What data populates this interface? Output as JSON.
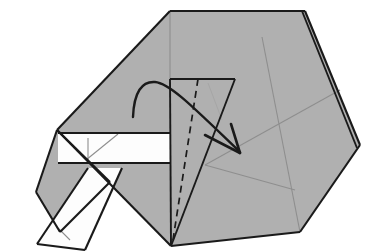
{
  "figure": {
    "background_color": "#ffffff",
    "paper_front_color": "#b0b0b0",
    "paper_back_color": "#fdfdfd",
    "outline_color": "#1a1a1a",
    "crease_color": "#8e8e8e"
  },
  "shapes": {
    "main_body": {
      "name": "main-paper-body",
      "points": "170,11 305,11 360,145 300,232 171,246 57,130"
    },
    "left_lower_triangle": {
      "name": "left-lower-gray-triangle",
      "points": "57,130 110,182 60,232 36,192"
    },
    "inner_gray_flap": {
      "name": "inner-gray-flap",
      "points": "170,79 235,79 171,246"
    },
    "white_band": {
      "name": "white-band",
      "points": "58,133 170,133 170,163 58,163"
    },
    "white_flap": {
      "name": "white-flap-lower-left",
      "points": "88,168 122,168 85,250 37,244"
    }
  },
  "edges": [
    {
      "name": "edge-top",
      "d": "M170,11 L305,11"
    },
    {
      "name": "edge-upper-right",
      "d": "M305,11 L360,145"
    },
    {
      "name": "edge-right-layer",
      "d": "M302,11 L357,148"
    },
    {
      "name": "edge-lower-right",
      "d": "M360,145 L300,232"
    },
    {
      "name": "edge-bottom",
      "d": "M300,232 L171,246"
    },
    {
      "name": "edge-lower-left",
      "d": "M171,246 L57,130"
    },
    {
      "name": "edge-upper-left",
      "d": "M57,130 L170,11"
    },
    {
      "name": "edge-left-triangle-upper",
      "d": "M57,130 L110,182"
    },
    {
      "name": "edge-left-triangle-lower",
      "d": "M110,182 L60,232"
    },
    {
      "name": "edge-left-triangle-back",
      "d": "M60,232 L36,192"
    },
    {
      "name": "edge-left-triangle-close",
      "d": "M36,192 L57,130"
    },
    {
      "name": "edge-inner-flap-top",
      "d": "M170,79 L235,79"
    },
    {
      "name": "edge-inner-flap-left",
      "d": "M170,79 L171,246"
    },
    {
      "name": "edge-inner-flap-right",
      "d": "M235,79 L171,246"
    },
    {
      "name": "edge-white-band-top",
      "d": "M58,133 L170,133"
    },
    {
      "name": "edge-white-band-bottom",
      "d": "M58,163 L170,163"
    },
    {
      "name": "edge-white-flap-top",
      "d": "M88,168 L37,244"
    },
    {
      "name": "edge-white-flap-bottom",
      "d": "M122,168 L85,250"
    },
    {
      "name": "edge-white-flap-end",
      "d": "M37,244 L85,250"
    }
  ],
  "creases": [
    {
      "name": "crease-center-vertical",
      "d": "M170,11 L170,79"
    },
    {
      "name": "crease-right-diagonal-down",
      "d": "M262,37 L300,232"
    },
    {
      "name": "crease-right-diagonal-up",
      "d": "M340,90 L205,165"
    },
    {
      "name": "crease-lower-right-band",
      "d": "M205,165 L295,190"
    },
    {
      "name": "crease-inner-flap-thin",
      "d": "M208,83 L222,120"
    },
    {
      "name": "crease-band-tick-vertical",
      "d": "M88,138 L88,160"
    },
    {
      "name": "crease-band-tick-diagonal",
      "d": "M86,160 L118,134"
    },
    {
      "name": "crease-flap-tick",
      "d": "M58,228 L70,240"
    }
  ],
  "fold_line": {
    "name": "valley-fold-dashed-line",
    "d": "M198,79 L172,246"
  },
  "arrow": {
    "name": "fold-direction-arrow",
    "curve": "M133,117 C134,92 142,81 155,82 C170,83 196,110 240,152",
    "head_left": "M205,135 L240,153",
    "head_right": "M231,124 L240,153",
    "direction": "fold right and down"
  }
}
